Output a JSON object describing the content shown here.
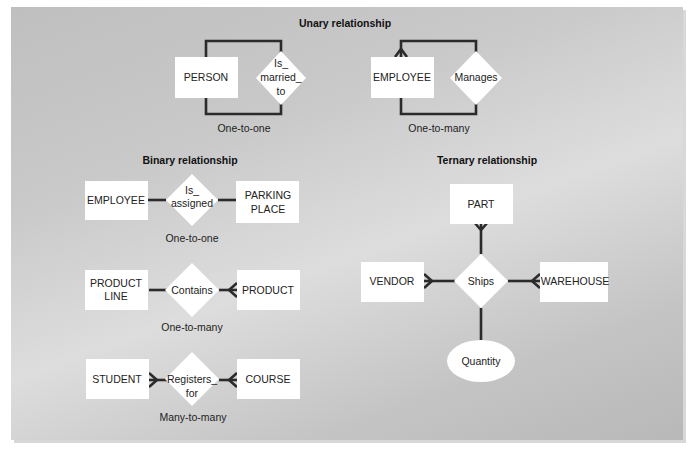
{
  "sections": {
    "unary": {
      "title": "Unary relationship",
      "examples": [
        {
          "entity": "PERSON",
          "relationship": [
            "Is_",
            "married_",
            "to"
          ],
          "cardinality": "One-to-one"
        },
        {
          "entity": "EMPLOYEE",
          "relationship": [
            "Manages"
          ],
          "cardinality": "One-to-many"
        }
      ]
    },
    "binary": {
      "title": "Binary relationship",
      "examples": [
        {
          "left": [
            "EMPLOYEE"
          ],
          "relationship": [
            "Is_",
            "assigned"
          ],
          "right": [
            "PARKING",
            "PLACE"
          ],
          "cardinality": "One-to-one"
        },
        {
          "left": [
            "PRODUCT",
            "LINE"
          ],
          "relationship": [
            "Contains"
          ],
          "right": [
            "PRODUCT"
          ],
          "cardinality": "One-to-many"
        },
        {
          "left": [
            "STUDENT"
          ],
          "relationship": [
            "Registers_",
            "for"
          ],
          "right": [
            "COURSE"
          ],
          "cardinality": "Many-to-many"
        }
      ]
    },
    "ternary": {
      "title": "Ternary relationship",
      "entities": {
        "top": "PART",
        "left": "VENDOR",
        "right": "WAREHOUSE"
      },
      "relationship": "Ships",
      "attribute": "Quantity"
    }
  },
  "colors": {
    "background": "#c8c8c8",
    "entity_fill": "#ffffff",
    "line": "#2b2b2b",
    "text": "#222222"
  }
}
